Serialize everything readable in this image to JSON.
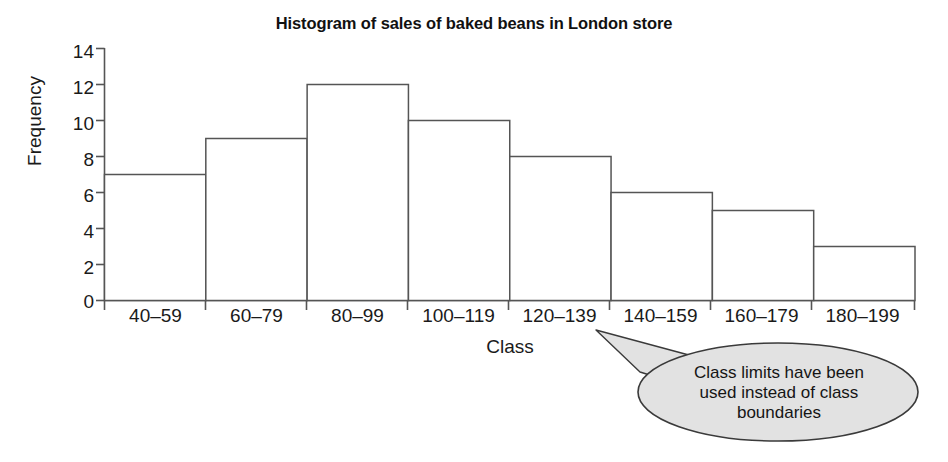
{
  "chart_data": {
    "type": "bar",
    "title": "Histogram of sales of baked beans in London store",
    "xlabel": "Class",
    "ylabel": "Frequency",
    "categories": [
      "40–59",
      "60–79",
      "80–99",
      "100–119",
      "120–139",
      "140–159",
      "160–179",
      "180–199"
    ],
    "values": [
      7,
      9,
      12,
      10,
      8,
      6,
      5,
      3
    ],
    "ylim": [
      0,
      14
    ],
    "yticks": [
      0,
      2,
      4,
      6,
      8,
      10,
      12,
      14
    ],
    "ytick_labels": [
      "0",
      "2",
      "4",
      "6",
      "8",
      "10",
      "12",
      "14"
    ],
    "grid": false,
    "legend": "none",
    "bar_fill_color": "#ffffff",
    "bar_edge_color": "#555555",
    "axis_color": "#555555",
    "annotations": [
      {
        "text_line_1": "Class limits have been",
        "text_line_2": "used instead of class",
        "text_line_3": "boundaries",
        "full_text": "Class limits have been used instead of class boundaries",
        "shape": "ellipse-callout",
        "fill_color": "#e2e2e2",
        "edge_color": "#3a3a3a",
        "points_to": "140–159"
      }
    ]
  }
}
